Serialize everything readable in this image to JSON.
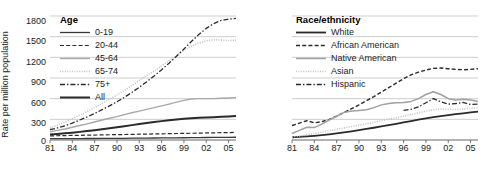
{
  "chart_data": [
    {
      "type": "line",
      "title": "Age",
      "xlabel": "",
      "ylabel": "Rate per million population",
      "ylim": [
        0,
        1800
      ],
      "yticks": [
        0,
        300,
        600,
        900,
        1200,
        1500,
        1800
      ],
      "xticks": [
        "81",
        "84",
        "87",
        "90",
        "93",
        "96",
        "99",
        "02",
        "05"
      ],
      "xlim": [
        1981,
        2006
      ],
      "grid": "horizontal",
      "legend_position": "top-left",
      "x": [
        1981,
        1982,
        1983,
        1984,
        1985,
        1986,
        1987,
        1988,
        1989,
        1990,
        1991,
        1992,
        1993,
        1994,
        1995,
        1996,
        1997,
        1998,
        1999,
        2000,
        2001,
        2002,
        2003,
        2004,
        2005,
        2006
      ],
      "series": [
        {
          "name": "0-19",
          "style": "solid",
          "color": "#3a3a3a",
          "width": 1.3,
          "values": [
            20,
            20,
            20,
            21,
            21,
            22,
            22,
            23,
            24,
            24,
            25,
            26,
            27,
            28,
            29,
            30,
            31,
            32,
            33,
            34,
            35,
            36,
            37,
            38,
            39,
            40
          ]
        },
        {
          "name": "20-44",
          "style": "dashed",
          "color": "#2a2a2a",
          "width": 1.2,
          "values": [
            60,
            62,
            64,
            66,
            68,
            70,
            72,
            74,
            76,
            78,
            80,
            82,
            84,
            86,
            88,
            90,
            92,
            94,
            96,
            98,
            100,
            102,
            104,
            106,
            108,
            110
          ]
        },
        {
          "name": "45-64",
          "style": "solid",
          "color": "#a8a8a8",
          "width": 1.4,
          "values": [
            120,
            140,
            160,
            185,
            210,
            235,
            262,
            290,
            315,
            340,
            368,
            395,
            420,
            445,
            470,
            495,
            520,
            550,
            575,
            595,
            600,
            600,
            600,
            605,
            610,
            615
          ]
        },
        {
          "name": "65-74",
          "style": "dotted",
          "color": "#c2c2c2",
          "width": 1.6,
          "values": [
            175,
            215,
            260,
            310,
            360,
            415,
            470,
            530,
            590,
            655,
            720,
            790,
            865,
            940,
            1000,
            1075,
            1150,
            1225,
            1300,
            1360,
            1405,
            1440,
            1455,
            1450,
            1445,
            1450
          ]
        },
        {
          "name": "75+",
          "style": "dashdot",
          "color": "#2a2a2a",
          "width": 1.3,
          "values": [
            150,
            175,
            205,
            245,
            290,
            335,
            385,
            440,
            495,
            555,
            620,
            690,
            765,
            845,
            930,
            1020,
            1115,
            1215,
            1320,
            1430,
            1530,
            1620,
            1690,
            1735,
            1755,
            1765
          ]
        },
        {
          "name": "All",
          "style": "solid",
          "color": "#2a2a2a",
          "width": 2.0,
          "values": [
            80,
            88,
            97,
            107,
            118,
            130,
            143,
            157,
            171,
            186,
            201,
            216,
            231,
            246,
            260,
            274,
            287,
            298,
            308,
            316,
            322,
            327,
            332,
            337,
            342,
            348
          ]
        }
      ]
    },
    {
      "type": "line",
      "title": "Race/ethnicity",
      "xlabel": "",
      "ylabel": "",
      "ylim": [
        0,
        1800
      ],
      "yticks": [
        0,
        300,
        600,
        900,
        1200,
        1500,
        1800
      ],
      "xticks": [
        "81",
        "84",
        "87",
        "90",
        "93",
        "96",
        "99",
        "02",
        "05"
      ],
      "xlim": [
        1981,
        2006
      ],
      "grid": "horizontal",
      "legend_position": "top-left",
      "x": [
        1981,
        1982,
        1983,
        1984,
        1985,
        1986,
        1987,
        1988,
        1989,
        1990,
        1991,
        1992,
        1993,
        1994,
        1995,
        1996,
        1997,
        1998,
        1999,
        2000,
        2001,
        2002,
        2003,
        2004,
        2005,
        2006
      ],
      "series": [
        {
          "name": "White",
          "style": "solid",
          "color": "#2a2a2a",
          "width": 1.8,
          "values": [
            40,
            45,
            52,
            60,
            70,
            82,
            95,
            110,
            125,
            142,
            160,
            178,
            197,
            216,
            235,
            255,
            275,
            295,
            315,
            332,
            348,
            362,
            375,
            388,
            400,
            412
          ]
        },
        {
          "name": "African American",
          "style": "dashed",
          "color": "#2a2a2a",
          "width": 1.4,
          "values": [
            210,
            245,
            280,
            250,
            265,
            300,
            345,
            400,
            455,
            510,
            570,
            630,
            695,
            760,
            825,
            890,
            945,
            985,
            1015,
            1040,
            1045,
            1035,
            1025,
            1020,
            1025,
            1035
          ]
        },
        {
          "name": "Native American",
          "style": "solid",
          "color": "#a0a0a0",
          "width": 1.5,
          "values": [
            95,
            140,
            185,
            180,
            230,
            290,
            345,
            400,
            420,
            430,
            440,
            470,
            510,
            530,
            540,
            545,
            560,
            600,
            660,
            700,
            660,
            600,
            580,
            590,
            580,
            560
          ]
        },
        {
          "name": "Asian",
          "style": "dotted",
          "color": "#c2c2c2",
          "width": 1.6,
          "values": [
            40,
            55,
            75,
            95,
            115,
            135,
            155,
            175,
            195,
            215,
            235,
            255,
            278,
            300,
            322,
            345,
            370,
            395,
            420,
            440,
            448,
            445,
            442,
            450,
            460,
            470
          ]
        },
        {
          "name": "Hispanic",
          "style": "dashdot",
          "color": "#2a2a2a",
          "width": 1.3,
          "values": [
            null,
            null,
            null,
            null,
            null,
            null,
            null,
            null,
            null,
            null,
            null,
            null,
            null,
            null,
            null,
            430,
            445,
            480,
            540,
            600,
            555,
            520,
            530,
            545,
            515,
            520
          ]
        }
      ]
    }
  ]
}
